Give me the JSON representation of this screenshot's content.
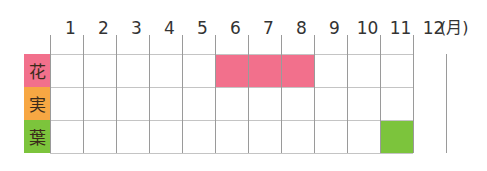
{
  "chart_data": {
    "type": "table",
    "title": "",
    "months": [
      "1",
      "2",
      "3",
      "4",
      "5",
      "6",
      "7",
      "8",
      "9",
      "10",
      "11",
      "12"
    ],
    "unit_label": "(月)",
    "rows": [
      {
        "label": "花",
        "color": "#f2708c",
        "months_active": [
          6,
          7,
          8
        ]
      },
      {
        "label": "実",
        "color": "#f7a743",
        "months_active": []
      },
      {
        "label": "葉",
        "color": "#7cc43c",
        "months_active": [
          11
        ]
      }
    ],
    "grid": true
  }
}
